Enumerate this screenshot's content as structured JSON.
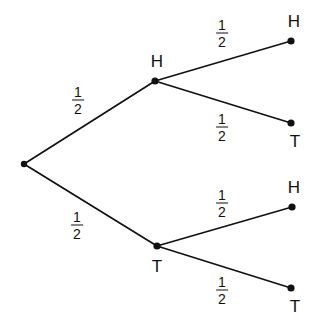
{
  "diagram": {
    "type": "probability-tree",
    "background_color": "#ffffff",
    "stroke_color": "#111111",
    "node_color": "#111111",
    "nodes": [
      {
        "id": "root",
        "label": "",
        "x": 24,
        "y": 164,
        "radius": 3.2,
        "label_dx": 0,
        "label_dy": 0
      },
      {
        "id": "h1",
        "label": "H",
        "x": 155,
        "y": 81,
        "radius": 3.6,
        "label_dx": 2,
        "label_dy": -20
      },
      {
        "id": "t1",
        "label": "T",
        "x": 157,
        "y": 246,
        "radius": 3.6,
        "label_dx": 0,
        "label_dy": 20
      },
      {
        "id": "hh",
        "label": "H",
        "x": 291,
        "y": 41,
        "radius": 3.6,
        "label_dx": 3,
        "label_dy": -20
      },
      {
        "id": "ht",
        "label": "T",
        "x": 291,
        "y": 123,
        "radius": 3.6,
        "label_dx": 4,
        "label_dy": 18
      },
      {
        "id": "th",
        "label": "H",
        "x": 292,
        "y": 207,
        "radius": 3.6,
        "label_dx": 2,
        "label_dy": -20
      },
      {
        "id": "tt",
        "label": "T",
        "x": 291,
        "y": 288,
        "radius": 3.6,
        "label_dx": 4,
        "label_dy": 18
      }
    ],
    "edges": [
      {
        "id": "root-h1",
        "from": "root",
        "to": "h1",
        "numerator": "1",
        "denominator": "2",
        "label_x": 78,
        "label_y": 100
      },
      {
        "id": "root-t1",
        "from": "root",
        "to": "t1",
        "numerator": "1",
        "denominator": "2",
        "label_x": 77,
        "label_y": 225
      },
      {
        "id": "h1-hh",
        "from": "h1",
        "to": "hh",
        "numerator": "1",
        "denominator": "2",
        "label_x": 222,
        "label_y": 33
      },
      {
        "id": "h1-ht",
        "from": "h1",
        "to": "ht",
        "numerator": "1",
        "denominator": "2",
        "label_x": 222,
        "label_y": 127
      },
      {
        "id": "t1-th",
        "from": "t1",
        "to": "th",
        "numerator": "1",
        "denominator": "2",
        "label_x": 222,
        "label_y": 203
      },
      {
        "id": "t1-tt",
        "from": "t1",
        "to": "tt",
        "numerator": "1",
        "denominator": "2",
        "label_x": 222,
        "label_y": 290
      }
    ]
  },
  "chart_data": {
    "type": "tree",
    "outcomes": [
      "HH",
      "HT",
      "TH",
      "TT"
    ],
    "branch_probabilities": [
      "1/2",
      "1/2",
      "1/2",
      "1/2",
      "1/2",
      "1/2"
    ],
    "outcome_probabilities": [
      "1/4",
      "1/4",
      "1/4",
      "1/4"
    ],
    "levels": 2,
    "level_labels": [
      [
        "H",
        "T"
      ],
      [
        "H",
        "T",
        "H",
        "T"
      ]
    ],
    "grid": false,
    "legend": "none"
  }
}
